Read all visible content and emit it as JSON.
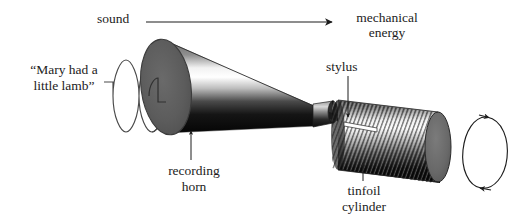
{
  "figure": {
    "background_color": "#ffffff",
    "ink_color": "#1c1c1c"
  },
  "labels": {
    "sound": "sound",
    "mechanical_energy_line1": "mechanical",
    "mechanical_energy_line2": "energy",
    "quote_line1": "“Mary had a",
    "quote_line2": "little lamb”",
    "stylus": "stylus",
    "recording_horn_line1": "recording",
    "recording_horn_line2": "horn",
    "tinfoil_cylinder_line1": "tinfoil",
    "tinfoil_cylinder_line2": "cylinder"
  },
  "annotations": {
    "sound_arrow": "horizontal-arrow-right",
    "horn_leader": "up-arrow-leader",
    "stylus_leader": "down-arrow-leader",
    "cylinder_leader": "up-arrow-leader",
    "rotation_indicator": "rotation-ellipse-arrows",
    "sound_wave": "sine-waveform-4-cycles"
  },
  "parts": {
    "horn": {
      "name": "recording horn",
      "shape": "cone",
      "mouth_color": "#5e5e5e",
      "body_dark": "#0a0a0a",
      "body_highlight": "#ffffff"
    },
    "diaphragm_neck": {
      "name": "diaphragm neck",
      "color": "#3a3a3a"
    },
    "stylus": {
      "name": "stylus",
      "color": "#ffffff"
    },
    "cylinder": {
      "name": "tinfoil cylinder",
      "groove_count": 44,
      "end_cap_color": "#6a6a6a",
      "body_dark": "#101010",
      "body_light": "#e8e8e8"
    }
  }
}
